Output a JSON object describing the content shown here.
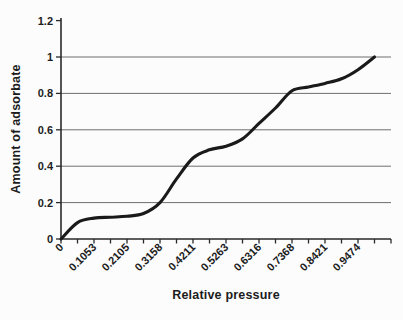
{
  "chart_data": {
    "type": "line",
    "title": "",
    "xlabel": "Relative pressure",
    "ylabel": "Amount of adsorbate",
    "x": [
      0,
      0.0526,
      0.1053,
      0.1579,
      0.2105,
      0.2632,
      0.3158,
      0.3684,
      0.4211,
      0.4737,
      0.5263,
      0.5789,
      0.6316,
      0.6842,
      0.7368,
      0.7895,
      0.8421,
      0.8947,
      0.9474,
      1.0
    ],
    "series": [
      {
        "values": [
          0.0,
          0.09,
          0.115,
          0.12,
          0.125,
          0.14,
          0.2,
          0.33,
          0.445,
          0.49,
          0.51,
          0.55,
          0.635,
          0.72,
          0.815,
          0.835,
          0.855,
          0.88,
          0.93,
          1.0
        ]
      }
    ],
    "x_tick_labels": [
      "0",
      "0.1053",
      "0.2105",
      "0.3158",
      "0.4211",
      "0.5263",
      "0.6316",
      "0.7368",
      "0.8421",
      "0.9474"
    ],
    "x_label_every": 2,
    "y_ticks": [
      0,
      0.2,
      0.4,
      0.6,
      0.8,
      1,
      1.2
    ],
    "y_tick_labels": [
      "0",
      "0.2",
      "0.4",
      "0.6",
      "0.8",
      "1",
      "1.2"
    ],
    "gridline_values": [
      0.2,
      0.4,
      0.6,
      0.8,
      1
    ],
    "ylim": [
      0,
      1.2
    ],
    "grid": "horizontal",
    "legend": "none",
    "smoothed_line": true,
    "colors": {
      "line": "#1a1a1a",
      "grid": "#6e6e6e",
      "axis": "#2a2a2a",
      "text": "#1c1c1c",
      "background": "#fcfcfc"
    }
  }
}
